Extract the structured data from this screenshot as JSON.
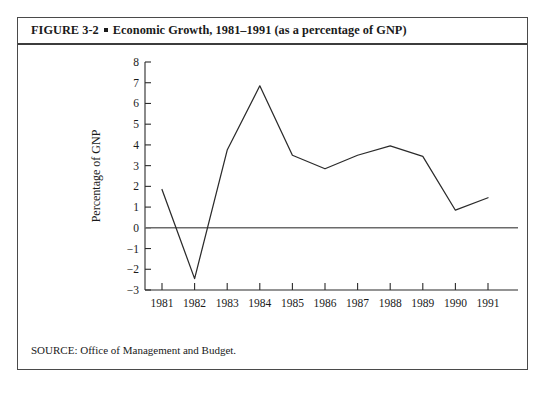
{
  "figure": {
    "label": "FIGURE 3-2",
    "bullet": "square-bullet",
    "caption": "Economic Growth, 1981–1991 (as a percentage of GNP)",
    "source": "SOURCE: Office of Management and Budget."
  },
  "chart_data": {
    "type": "line",
    "title": "Economic Growth, 1981–1991 (as a percentage of GNP)",
    "xlabel": "",
    "ylabel": "Percentage of GNP",
    "categories": [
      "1981",
      "1982",
      "1983",
      "1984",
      "1985",
      "1986",
      "1987",
      "1988",
      "1989",
      "1990",
      "1991"
    ],
    "values": [
      1.85,
      -2.45,
      3.75,
      6.85,
      3.5,
      2.85,
      3.5,
      3.95,
      3.45,
      0.85,
      1.45
    ],
    "ylim": [
      -3,
      8
    ],
    "ytick_labels": [
      "8",
      "7",
      "6",
      "5",
      "4",
      "3",
      "2",
      "1",
      "0",
      "−1",
      "−2",
      "−3"
    ],
    "ytick_values": [
      8,
      7,
      6,
      5,
      4,
      3,
      2,
      1,
      0,
      -1,
      -2,
      -3
    ],
    "grid": false,
    "legend": false,
    "zero_reference_line": 0,
    "line_color": "#2b2b2b",
    "axis_color": "#2b2b2b",
    "zero_line_color": "#6b6b6b",
    "background": "#ffffff"
  }
}
